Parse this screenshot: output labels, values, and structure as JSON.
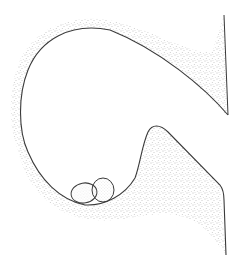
{
  "illustration": {
    "subject": "stippled cross-section drawing of a cup-shaped chamber with two eggs",
    "elements": {
      "chamber": "cup-shaped cavity wall with stippled shading",
      "eggs": [
        "egg-left",
        "egg-right"
      ]
    },
    "colors": {
      "background": "#ffffff",
      "outline": "#3a3a3a",
      "stipple": "#7a7a7a"
    }
  }
}
